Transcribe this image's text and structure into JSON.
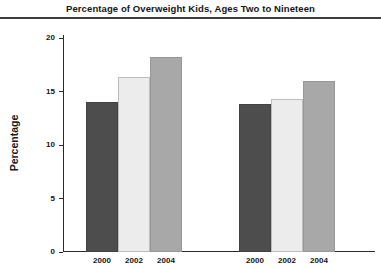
{
  "figure": {
    "title": "Percentage of Overweight Kids, Ages Two to Nineteen",
    "ylabel": "Percentage"
  },
  "chart_data": {
    "type": "bar",
    "title": "Percentage of Overweight Kids, Ages Two to Nineteen",
    "xlabel": "",
    "ylabel": "Percentage",
    "ylim": [
      0,
      20
    ],
    "yticks": [
      0,
      5,
      10,
      15,
      20
    ],
    "grid": false,
    "legend": "none",
    "categories": [
      "2000",
      "2002",
      "2004"
    ],
    "groups": [
      {
        "id": "group-1",
        "values": [
          14.0,
          16.4,
          18.2
        ]
      },
      {
        "id": "group-2",
        "values": [
          13.8,
          14.3,
          16.0
        ]
      }
    ],
    "bar_colors": [
      "#4d4d4d",
      "#ececec",
      "#a8a8a8"
    ],
    "bar_border_colors": [
      "#424242",
      "#bdbdbd",
      "#979797"
    ],
    "axis_color": "#2b2b2b",
    "text_color": "#141414"
  }
}
